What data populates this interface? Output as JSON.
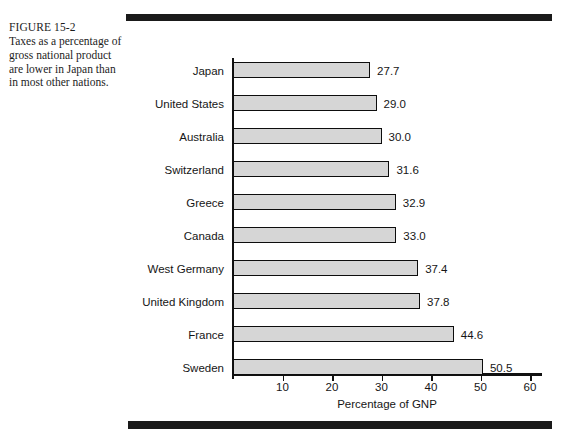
{
  "caption": {
    "figure_number": "FIGURE 15-2",
    "text": "Taxes as a percentage of gross national product are lower in Japan than in most other nations."
  },
  "chart_data": {
    "type": "bar",
    "orientation": "horizontal",
    "title": "",
    "xlabel": "Percentage of GNP",
    "ylabel": "",
    "categories": [
      "Japan",
      "United States",
      "Australia",
      "Switzerland",
      "Greece",
      "Canada",
      "West Germany",
      "United Kingdom",
      "France",
      "Sweden"
    ],
    "values": [
      27.7,
      29.0,
      30.0,
      31.6,
      32.9,
      33.0,
      37.4,
      37.8,
      44.6,
      50.5
    ],
    "value_labels": [
      "27.7",
      "29.0",
      "30.0",
      "31.6",
      "32.9",
      "33.0",
      "37.4",
      "37.8",
      "44.6",
      "50.5"
    ],
    "xlim": [
      0,
      65
    ],
    "xticks": [
      10,
      20,
      30,
      40,
      50,
      60
    ],
    "xtick_labels": [
      "10",
      "20",
      "30",
      "40",
      "50",
      "60"
    ],
    "grid": false,
    "legend": null,
    "bar_fill_color": "#d6d6d6",
    "bar_edge_color": "#0d0d0d",
    "axis_color": "#111111"
  },
  "decoration": {
    "rule_color": "#1a1a1a"
  }
}
